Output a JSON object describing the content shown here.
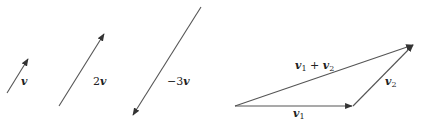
{
  "diagram": {
    "scaling": {
      "vectors": [
        {
          "name": "v",
          "label_sym": "v",
          "label_coef": "",
          "scale": 1
        },
        {
          "name": "2v",
          "label_sym": "v",
          "label_coef": "2",
          "scale": 2
        },
        {
          "name": "-3v",
          "label_sym": "v",
          "label_coef": "−3",
          "scale": -3
        }
      ]
    },
    "addition": {
      "v1": {
        "sym": "v",
        "sub": "1"
      },
      "v2": {
        "sym": "v",
        "sub": "2"
      },
      "sum": {
        "sym1": "v",
        "sub1": "1",
        "op": " + ",
        "sym2": "v",
        "sub2": "2"
      }
    },
    "colors": {
      "stroke": "#555555",
      "text": "#222222",
      "background": "#ffffff"
    }
  }
}
